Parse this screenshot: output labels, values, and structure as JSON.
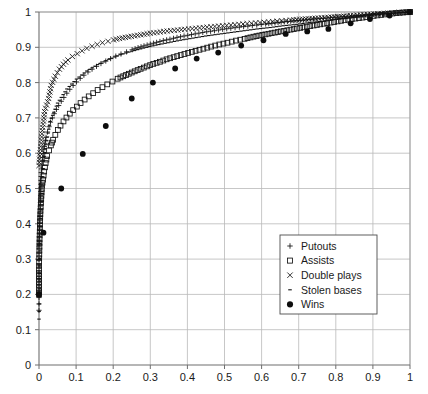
{
  "chart_data": {
    "type": "scatter",
    "title": "",
    "subtitle": "",
    "xlabel": "",
    "ylabel": "",
    "xlim": [
      0,
      1
    ],
    "ylim": [
      0,
      1
    ],
    "grid": true,
    "legend_position": "lower-right-inside",
    "xticks": [
      "0",
      "0.1",
      "0.2",
      "0.3",
      "0.4",
      "0.5",
      "0.6",
      "0.7",
      "0.8",
      "0.9",
      "1"
    ],
    "yticks": [
      "0",
      "0.1",
      "0.2",
      "0.3",
      "0.4",
      "0.5",
      "0.6",
      "0.7",
      "0.8",
      "0.9",
      "1"
    ],
    "xtick_values": [
      0,
      0.1,
      0.2,
      0.3,
      0.4,
      0.5,
      0.6,
      0.7,
      0.8,
      0.9,
      1
    ],
    "ytick_values": [
      0,
      0.1,
      0.2,
      0.3,
      0.4,
      0.5,
      0.6,
      0.7,
      0.8,
      0.9,
      1
    ],
    "series": [
      {
        "name": "Putouts",
        "marker": "plus",
        "color": "#111111",
        "points": [
          [
            0.0,
            0.155
          ],
          [
            0.0,
            0.335
          ],
          [
            0.003,
            0.43
          ],
          [
            0.004,
            0.47
          ],
          [
            0.005,
            0.512
          ],
          [
            0.006,
            0.545
          ],
          [
            0.008,
            0.566
          ],
          [
            0.01,
            0.588
          ],
          [
            0.013,
            0.61
          ],
          [
            0.016,
            0.628
          ],
          [
            0.019,
            0.645
          ],
          [
            0.023,
            0.66
          ],
          [
            0.027,
            0.675
          ],
          [
            0.031,
            0.688
          ],
          [
            0.036,
            0.7
          ],
          [
            0.041,
            0.712
          ],
          [
            0.047,
            0.724
          ],
          [
            0.053,
            0.735
          ],
          [
            0.06,
            0.747
          ],
          [
            0.067,
            0.758
          ],
          [
            0.075,
            0.77
          ],
          [
            0.083,
            0.781
          ],
          [
            0.092,
            0.792
          ],
          [
            0.101,
            0.802
          ],
          [
            0.111,
            0.812
          ],
          [
            0.121,
            0.821
          ],
          [
            0.132,
            0.83
          ],
          [
            0.143,
            0.838
          ],
          [
            0.155,
            0.846
          ],
          [
            0.167,
            0.854
          ],
          [
            0.18,
            0.861
          ],
          [
            0.193,
            0.868
          ],
          [
            0.207,
            0.875
          ],
          [
            0.221,
            0.881
          ],
          [
            0.236,
            0.887
          ],
          [
            0.251,
            0.893
          ],
          [
            0.267,
            0.899
          ],
          [
            0.283,
            0.904
          ],
          [
            0.3,
            0.909
          ],
          [
            0.317,
            0.914
          ],
          [
            0.335,
            0.919
          ],
          [
            0.353,
            0.923
          ],
          [
            0.372,
            0.928
          ],
          [
            0.391,
            0.932
          ],
          [
            0.411,
            0.936
          ],
          [
            0.431,
            0.94
          ],
          [
            0.452,
            0.944
          ],
          [
            0.473,
            0.947
          ],
          [
            0.495,
            0.951
          ],
          [
            0.517,
            0.954
          ],
          [
            0.54,
            0.957
          ],
          [
            0.563,
            0.96
          ],
          [
            0.587,
            0.963
          ],
          [
            0.611,
            0.966
          ],
          [
            0.636,
            0.969
          ],
          [
            0.661,
            0.972
          ],
          [
            0.687,
            0.975
          ],
          [
            0.713,
            0.977
          ],
          [
            0.74,
            0.98
          ],
          [
            0.767,
            0.982
          ],
          [
            0.795,
            0.985
          ],
          [
            0.823,
            0.987
          ],
          [
            0.852,
            0.99
          ],
          [
            0.881,
            0.992
          ],
          [
            0.911,
            0.994
          ],
          [
            0.941,
            0.996
          ],
          [
            0.971,
            0.998
          ],
          [
            1.0,
            1.0
          ]
        ]
      },
      {
        "name": "Assists",
        "marker": "square",
        "color": "#111111",
        "points": [
          [
            0.0,
            0.2
          ],
          [
            0.0,
            0.27
          ],
          [
            0.002,
            0.378
          ],
          [
            0.004,
            0.437
          ],
          [
            0.006,
            0.47
          ],
          [
            0.008,
            0.508
          ],
          [
            0.011,
            0.525
          ],
          [
            0.014,
            0.548
          ],
          [
            0.018,
            0.572
          ],
          [
            0.022,
            0.592
          ],
          [
            0.027,
            0.608
          ],
          [
            0.032,
            0.622
          ],
          [
            0.038,
            0.638
          ],
          [
            0.044,
            0.652
          ],
          [
            0.051,
            0.666
          ],
          [
            0.058,
            0.678
          ],
          [
            0.066,
            0.69
          ],
          [
            0.074,
            0.701
          ],
          [
            0.083,
            0.712
          ],
          [
            0.092,
            0.722
          ],
          [
            0.102,
            0.732
          ],
          [
            0.112,
            0.742
          ],
          [
            0.123,
            0.752
          ],
          [
            0.134,
            0.761
          ],
          [
            0.146,
            0.77
          ],
          [
            0.158,
            0.779
          ],
          [
            0.171,
            0.787
          ],
          [
            0.184,
            0.795
          ],
          [
            0.198,
            0.803
          ],
          [
            0.212,
            0.811
          ],
          [
            0.227,
            0.818
          ],
          [
            0.242,
            0.825
          ],
          [
            0.258,
            0.832
          ],
          [
            0.274,
            0.839
          ],
          [
            0.291,
            0.846
          ],
          [
            0.308,
            0.853
          ],
          [
            0.326,
            0.859
          ],
          [
            0.344,
            0.866
          ],
          [
            0.363,
            0.872
          ],
          [
            0.382,
            0.878
          ],
          [
            0.402,
            0.884
          ],
          [
            0.422,
            0.89
          ],
          [
            0.443,
            0.896
          ],
          [
            0.464,
            0.902
          ],
          [
            0.486,
            0.908
          ],
          [
            0.508,
            0.913
          ],
          [
            0.531,
            0.919
          ],
          [
            0.554,
            0.924
          ],
          [
            0.578,
            0.93
          ],
          [
            0.602,
            0.935
          ],
          [
            0.627,
            0.94
          ],
          [
            0.652,
            0.945
          ],
          [
            0.678,
            0.95
          ],
          [
            0.704,
            0.955
          ],
          [
            0.731,
            0.96
          ],
          [
            0.758,
            0.965
          ],
          [
            0.786,
            0.97
          ],
          [
            0.814,
            0.975
          ],
          [
            0.843,
            0.98
          ],
          [
            0.872,
            0.984
          ],
          [
            0.902,
            0.989
          ],
          [
            0.932,
            0.993
          ],
          [
            0.963,
            0.997
          ],
          [
            1.0,
            1.0
          ]
        ]
      },
      {
        "name": "Double plays",
        "marker": "cross",
        "color": "#111111",
        "points": [
          [
            0.0,
            0.565
          ],
          [
            0.008,
            0.655
          ],
          [
            0.015,
            0.718
          ],
          [
            0.026,
            0.755
          ],
          [
            0.033,
            0.792
          ],
          [
            0.044,
            0.818
          ],
          [
            0.055,
            0.838
          ],
          [
            0.066,
            0.852
          ],
          [
            0.078,
            0.864
          ],
          [
            0.09,
            0.874
          ],
          [
            0.103,
            0.882
          ],
          [
            0.116,
            0.89
          ],
          [
            0.129,
            0.897
          ],
          [
            0.143,
            0.903
          ],
          [
            0.157,
            0.908
          ],
          [
            0.171,
            0.913
          ],
          [
            0.186,
            0.917
          ],
          [
            0.201,
            0.921
          ],
          [
            0.217,
            0.925
          ],
          [
            0.233,
            0.928
          ],
          [
            0.249,
            0.931
          ],
          [
            0.266,
            0.934
          ],
          [
            0.283,
            0.937
          ],
          [
            0.3,
            0.94
          ],
          [
            0.318,
            0.942
          ],
          [
            0.336,
            0.945
          ],
          [
            0.355,
            0.947
          ],
          [
            0.374,
            0.949
          ],
          [
            0.393,
            0.951
          ],
          [
            0.413,
            0.953
          ],
          [
            0.433,
            0.955
          ],
          [
            0.453,
            0.957
          ],
          [
            0.474,
            0.959
          ],
          [
            0.495,
            0.961
          ],
          [
            0.517,
            0.963
          ],
          [
            0.539,
            0.965
          ],
          [
            0.561,
            0.967
          ],
          [
            0.584,
            0.969
          ],
          [
            0.607,
            0.971
          ],
          [
            0.63,
            0.973
          ],
          [
            0.654,
            0.975
          ],
          [
            0.678,
            0.977
          ],
          [
            0.703,
            0.979
          ],
          [
            0.728,
            0.981
          ],
          [
            0.753,
            0.983
          ],
          [
            0.779,
            0.985
          ],
          [
            0.805,
            0.987
          ],
          [
            0.831,
            0.989
          ],
          [
            0.858,
            0.991
          ],
          [
            0.885,
            0.993
          ],
          [
            0.913,
            0.995
          ],
          [
            0.941,
            0.997
          ],
          [
            0.97,
            0.999
          ],
          [
            1.0,
            1.0
          ]
        ]
      },
      {
        "name": "Stolen bases",
        "marker": "dash",
        "color": "#111111",
        "points": [
          [
            0.0,
            0.13
          ],
          [
            0.003,
            0.345
          ],
          [
            0.012,
            0.58
          ],
          [
            0.03,
            0.69
          ],
          [
            0.05,
            0.742
          ],
          [
            0.075,
            0.782
          ],
          [
            0.101,
            0.81
          ],
          [
            0.129,
            0.833
          ],
          [
            0.158,
            0.851
          ],
          [
            0.188,
            0.866
          ],
          [
            0.219,
            0.879
          ],
          [
            0.25,
            0.889
          ],
          [
            0.282,
            0.898
          ],
          [
            0.315,
            0.906
          ],
          [
            0.348,
            0.913
          ],
          [
            0.381,
            0.92
          ],
          [
            0.415,
            0.926
          ],
          [
            0.449,
            0.932
          ],
          [
            0.483,
            0.937
          ],
          [
            0.518,
            0.942
          ],
          [
            0.553,
            0.947
          ],
          [
            0.588,
            0.952
          ],
          [
            0.623,
            0.956
          ],
          [
            0.658,
            0.961
          ],
          [
            0.694,
            0.965
          ],
          [
            0.729,
            0.97
          ],
          [
            0.765,
            0.974
          ],
          [
            0.801,
            0.979
          ],
          [
            0.837,
            0.983
          ],
          [
            0.873,
            0.988
          ],
          [
            0.909,
            0.992
          ],
          [
            0.945,
            0.996
          ],
          [
            0.972,
            0.998
          ],
          [
            1.0,
            1.0
          ]
        ]
      },
      {
        "name": "Wins",
        "marker": "dot",
        "color": "#0d0d0d",
        "points": [
          [
            0.0,
            0.2
          ],
          [
            0.012,
            0.375
          ],
          [
            0.06,
            0.5
          ],
          [
            0.118,
            0.598
          ],
          [
            0.18,
            0.677
          ],
          [
            0.25,
            0.755
          ],
          [
            0.307,
            0.8
          ],
          [
            0.367,
            0.84
          ],
          [
            0.425,
            0.868
          ],
          [
            0.483,
            0.885
          ],
          [
            0.545,
            0.905
          ],
          [
            0.605,
            0.92
          ],
          [
            0.665,
            0.938
          ],
          [
            0.723,
            0.945
          ],
          [
            0.78,
            0.952
          ],
          [
            0.84,
            0.968
          ],
          [
            0.892,
            0.98
          ],
          [
            0.945,
            0.99
          ],
          [
            1.0,
            1.0
          ]
        ]
      }
    ],
    "legend": [
      {
        "label": "Putouts",
        "marker": "plus"
      },
      {
        "label": "Assists",
        "marker": "square"
      },
      {
        "label": "Double plays",
        "marker": "cross"
      },
      {
        "label": "Stolen bases",
        "marker": "dash"
      },
      {
        "label": "Wins",
        "marker": "dot"
      }
    ],
    "colors": {
      "marker": "#111111",
      "grid": "#b9b9b9",
      "axis": "#6e6e6e",
      "legend_border": "#4d4d4d",
      "background": "#ffffff",
      "text": "#1a1a1a"
    }
  }
}
